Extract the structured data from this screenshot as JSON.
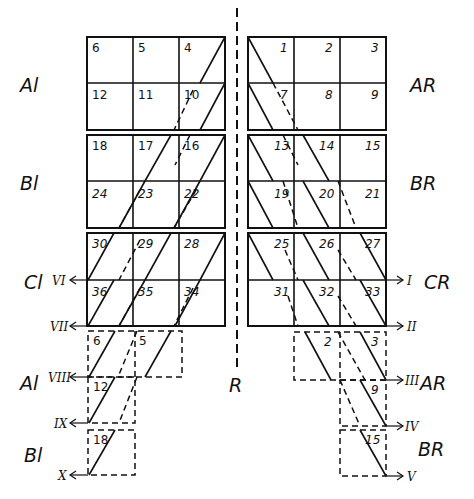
{
  "left_grid": {
    "rows": [
      [
        "6",
        "5",
        "4"
      ],
      [
        "12",
        "11",
        "10"
      ],
      [
        "18",
        "17",
        "16"
      ],
      [
        "24",
        "23",
        "22"
      ],
      [
        "30",
        "29",
        "28"
      ],
      [
        "36",
        "35",
        "34"
      ]
    ],
    "block_labels": [
      "Al",
      "Bl",
      "Cl"
    ]
  },
  "right_grid": {
    "rows": [
      [
        "1",
        "2",
        "3"
      ],
      [
        "7",
        "8",
        "9"
      ],
      [
        "13",
        "14",
        "15"
      ],
      [
        "19",
        "20",
        "21"
      ],
      [
        "25",
        "26",
        "27"
      ],
      [
        "31",
        "32",
        "33"
      ]
    ],
    "block_labels": [
      "AR",
      "BR",
      "CR"
    ]
  },
  "left_extension": {
    "cells": [
      "6",
      "5",
      "12",
      "18"
    ],
    "block_labels": [
      "Al",
      "Bl"
    ],
    "roman": [
      "VI",
      "VII",
      "VIII",
      "IX",
      "X"
    ]
  },
  "right_extension": {
    "cells": [
      "2",
      "3",
      "9",
      "15"
    ],
    "block_labels": [
      "AR",
      "BR"
    ],
    "roman": [
      "I",
      "II",
      "III",
      "IV",
      "V"
    ]
  },
  "axis_label": "R"
}
